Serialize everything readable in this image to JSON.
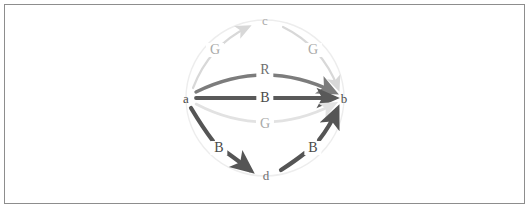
{
  "figure": {
    "kind": "directed-multigraph-diagram",
    "background_color": "#ffffff",
    "border_color": "#8d8d8d",
    "width": 530,
    "height": 209
  },
  "graph_data": {
    "type": "diagram",
    "layout": "circular",
    "circle_guide": {
      "center_x": 265,
      "center_y": 98,
      "radius_x": 79,
      "radius_y": 78,
      "color": "#ededed",
      "visible": true
    },
    "nodes": [
      {
        "id": "a",
        "label": "a",
        "x": 186,
        "y": 98,
        "color": "#4a4a4a"
      },
      {
        "id": "b",
        "label": "b",
        "x": 344,
        "y": 98,
        "color": "#4a4a4a"
      },
      {
        "id": "c",
        "label": "c",
        "x": 265,
        "y": 20,
        "color": "#a9a9a9"
      },
      {
        "id": "d",
        "label": "d",
        "x": 266,
        "y": 175,
        "color": "#6f6f6f"
      }
    ],
    "edges": [
      {
        "id": "a-c-G",
        "source": "a",
        "target": "c",
        "label": "G",
        "label_x": 215,
        "label_y": 50,
        "label_class": "lbl-light",
        "color": "#d8d8d8",
        "width": 2.2,
        "style": "curved",
        "path": "M 193 88 Q 209 46 248 27",
        "arrow": true
      },
      {
        "id": "c-b-G",
        "source": "c",
        "target": "b",
        "label": "G",
        "label_x": 313,
        "label_y": 50,
        "label_class": "lbl-light",
        "color": "#d8d8d8",
        "width": 2.2,
        "style": "curved",
        "path": "M 283 27 Q 322 46 338 88",
        "arrow": true
      },
      {
        "id": "a-b-R",
        "source": "a",
        "target": "b",
        "label": "R",
        "label_x": 265,
        "label_y": 70,
        "label_class": "lbl-mid",
        "color": "#7c7c7c",
        "width": 3.4,
        "style": "arc-above",
        "path": "M 196 92 Q 265 58 334 92",
        "arrow": true,
        "split_at_label": true
      },
      {
        "id": "a-b-B",
        "source": "a",
        "target": "b",
        "label": "B",
        "label_x": 265,
        "label_y": 98,
        "label_class": "lbl-dark",
        "color": "#595959",
        "width": 3.8,
        "style": "straight",
        "path": "M 196 98 L 334 98",
        "arrow": true,
        "split_at_label": true
      },
      {
        "id": "a-b-G",
        "source": "a",
        "target": "b",
        "label": "G",
        "label_x": 265,
        "label_y": 124,
        "label_class": "lbl-light",
        "color": "#e2e2e2",
        "width": 2.6,
        "style": "arc-below",
        "path": "M 196 104 Q 265 140 334 104",
        "arrow": true,
        "split_at_label": true
      },
      {
        "id": "a-d-B",
        "source": "a",
        "target": "d",
        "label": "B",
        "label_x": 219,
        "label_y": 148,
        "label_class": "lbl-dark",
        "color": "#555555",
        "width": 4.2,
        "style": "curved",
        "path": "M 191 108 Q 203 128 213 141",
        "arrow": false
      },
      {
        "id": "a-d-B-head",
        "source": "a",
        "target": "d",
        "label": "",
        "color": "#555555",
        "width": 4.2,
        "style": "curved",
        "path": "M 226 152 Q 240 162 250 170",
        "arrow": true
      },
      {
        "id": "d-b-B",
        "source": "d",
        "target": "b",
        "label": "B",
        "label_x": 313,
        "label_y": 148,
        "label_class": "lbl-dark",
        "color": "#555555",
        "width": 4.2,
        "style": "curved",
        "path": "M 281 170 Q 295 161 305 153",
        "arrow": false
      },
      {
        "id": "d-b-B-head",
        "source": "d",
        "target": "b",
        "label": "",
        "color": "#555555",
        "width": 4.2,
        "style": "curved",
        "path": "M 319 140 Q 330 126 337 110",
        "arrow": true
      }
    ],
    "edge_labels_text": [
      "G",
      "G",
      "R",
      "B",
      "G",
      "B",
      "B"
    ],
    "node_labels_text": [
      "a",
      "b",
      "c",
      "d"
    ]
  }
}
